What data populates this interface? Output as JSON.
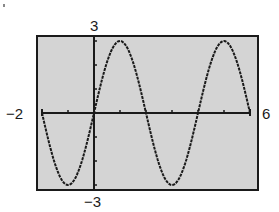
{
  "chart_data": {
    "type": "line",
    "title": "",
    "xlabel": "",
    "ylabel": "",
    "function": "y = 3 sin(pi x / 2)",
    "xlim": [
      -2,
      6
    ],
    "ylim": [
      -3,
      3
    ],
    "x_tick_step": 1,
    "y_tick_step": 1,
    "grid": false,
    "legend": null,
    "window_labels": {
      "xmin": "−2",
      "xmax": "6",
      "ymax": "3",
      "ymin": "−3"
    },
    "series": [
      {
        "name": "curve",
        "x": [
          -2,
          -1.5,
          -1,
          -0.5,
          0,
          0.5,
          1,
          1.5,
          2,
          2.5,
          3,
          3.5,
          4,
          4.5,
          5,
          5.5,
          6
        ],
        "values": [
          0,
          -2.12,
          -3,
          -2.12,
          0,
          2.12,
          3,
          2.12,
          0,
          -2.12,
          -3,
          -2.12,
          0,
          2.12,
          3,
          2.12,
          0
        ]
      }
    ],
    "colors": {
      "background": "#d4d4d4",
      "frame": "#1a1a1a",
      "curve": "#1a1a1a"
    }
  }
}
